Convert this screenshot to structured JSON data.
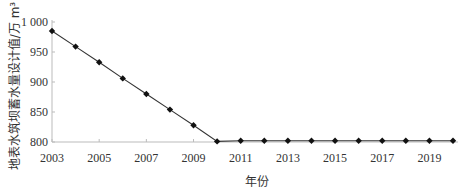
{
  "chart_data": {
    "type": "line",
    "title": "",
    "xlabel": "年份",
    "ylabel": "地表水筑坝蓄水量设计值/万 m³",
    "ylim": [
      800,
      1000
    ],
    "xlim": [
      2003,
      2020
    ],
    "yticks": [
      800,
      850,
      900,
      950,
      1000
    ],
    "ytick_labels": [
      "800",
      "850",
      "900",
      "950",
      "1 000"
    ],
    "xticks": [
      2003,
      2005,
      2007,
      2009,
      2011,
      2013,
      2015,
      2017,
      2019
    ],
    "xtick_labels": [
      "2003",
      "2005",
      "2007",
      "2009",
      "2011",
      "2013",
      "2015",
      "2017",
      "2019"
    ],
    "grid": false,
    "legend": null,
    "marker": "diamond",
    "x": [
      2003,
      2004,
      2005,
      2006,
      2007,
      2008,
      2009,
      2010,
      2011,
      2012,
      2013,
      2014,
      2015,
      2016,
      2017,
      2018,
      2019,
      2020
    ],
    "series": [
      {
        "name": "地表水筑坝蓄水量设计值",
        "values": [
          985,
          959,
          933,
          906,
          880,
          854,
          828,
          801,
          802,
          802,
          802,
          802,
          802,
          802,
          802,
          802,
          802,
          802
        ]
      }
    ]
  }
}
